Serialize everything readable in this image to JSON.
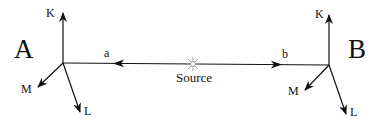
{
  "diagram": {
    "observers": [
      {
        "id": "A",
        "label": "A",
        "axes": {
          "up": "K",
          "down_left": "M",
          "down": "L"
        }
      },
      {
        "id": "B",
        "label": "B",
        "axes": {
          "up": "K",
          "down_left": "M",
          "down": "L"
        }
      }
    ],
    "source": {
      "label": "Source",
      "icon": "star-burst-icon"
    },
    "paths": [
      {
        "id": "a",
        "label": "a",
        "from": "Source",
        "to": "A"
      },
      {
        "id": "b",
        "label": "b",
        "from": "Source",
        "to": "B"
      }
    ],
    "colors": {
      "line": "#111111",
      "source_icon": "#aaaaaa",
      "background": "#ffffff"
    }
  }
}
